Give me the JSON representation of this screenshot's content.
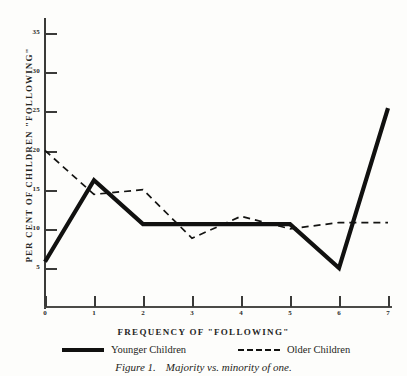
{
  "chart_data": {
    "type": "line",
    "title": "",
    "caption_label": "Figure 1.",
    "caption_text": "Majority vs. minority of one.",
    "xlabel": "FREQUENCY OF \"FOLLOWING\"",
    "ylabel": "PER CENT OF CHILDREN \"FOLLOWING\"",
    "x": [
      0,
      1,
      2,
      3,
      4,
      5,
      6,
      7
    ],
    "xtick_labels": [
      "0",
      "1",
      "2",
      "3",
      "4",
      "5",
      "6",
      "7"
    ],
    "ytick_labels": [
      "5",
      "10",
      "15",
      "20",
      "25",
      "30",
      "35"
    ],
    "ytick_values": [
      5,
      10,
      15,
      20,
      25,
      30,
      35
    ],
    "xlim": [
      0,
      7
    ],
    "ylim": [
      0,
      36.5
    ],
    "grid": false,
    "legend_position": "below-axis",
    "series": [
      {
        "name": "Younger Children",
        "style": "solid",
        "color": "#111110",
        "width": 4.2,
        "values": [
          5.8,
          16.2,
          10.6,
          10.6,
          10.6,
          10.6,
          5.0,
          25.4
        ]
      },
      {
        "name": "Older Children",
        "style": "dashed",
        "color": "#141412",
        "width": 1.7,
        "values": [
          20.0,
          14.4,
          15.0,
          8.8,
          11.6,
          10.0,
          10.8,
          10.8
        ]
      }
    ]
  }
}
